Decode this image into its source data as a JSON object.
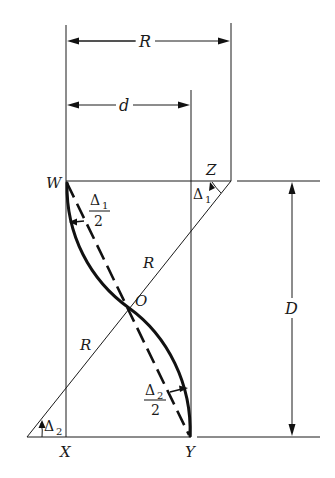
{
  "figure": {
    "labels": {
      "R_top": "R",
      "d_top": "d",
      "W": "W",
      "Z": "Z",
      "O": "O",
      "X": "X",
      "Y": "Y",
      "D": "D",
      "R_upper": "R",
      "R_lower": "R",
      "delta1": "Δ",
      "delta1_sub": "1",
      "delta2": "Δ",
      "delta2_sub": "2",
      "half_delta1_num": "Δ",
      "half_delta1_sub": "1",
      "half_delta1_den": "2",
      "half_delta2_num": "Δ",
      "half_delta2_sub": "2",
      "half_delta2_den": "2"
    }
  }
}
